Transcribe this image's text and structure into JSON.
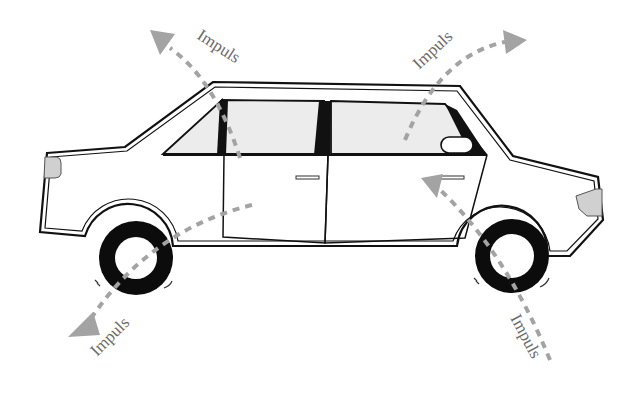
{
  "diagram": {
    "labels": [
      {
        "id": "top-left",
        "text": "Impuls"
      },
      {
        "id": "top-right",
        "text": "Impuls"
      },
      {
        "id": "bottom-left",
        "text": "Impuls"
      },
      {
        "id": "bottom-right",
        "text": "Impuls"
      }
    ],
    "colors": {
      "outline": "#111111",
      "glass": "#ececec",
      "arrow": "#a3a3a3",
      "lamp": "#d0d0d0",
      "label": "#6b6b6b"
    }
  }
}
